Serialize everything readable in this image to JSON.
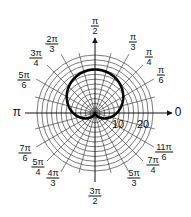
{
  "chart_data": {
    "type": "polar",
    "title": "",
    "curve": {
      "equation": "r = 9(1 + sin θ)",
      "description": "cardioid opening downward with cusp at origin",
      "a": 9,
      "color": "#000000"
    },
    "r_axis": {
      "ticks": [
        10,
        20
      ],
      "rings": [
        2,
        4,
        6,
        8,
        10,
        12,
        14,
        16,
        18,
        20,
        22,
        24
      ],
      "max": 24
    },
    "theta_spoke_step_deg": 15,
    "angle_labels": [
      {
        "num": "",
        "den": "",
        "text": "0",
        "angle_deg": 0
      },
      {
        "num": "π",
        "den": "6",
        "angle_deg": 30
      },
      {
        "num": "π",
        "den": "4",
        "angle_deg": 45
      },
      {
        "num": "π",
        "den": "3",
        "angle_deg": 60
      },
      {
        "num": "π",
        "den": "2",
        "angle_deg": 90
      },
      {
        "num": "2π",
        "den": "3",
        "angle_deg": 120
      },
      {
        "num": "3π",
        "den": "4",
        "angle_deg": 135
      },
      {
        "num": "5π",
        "den": "6",
        "angle_deg": 150
      },
      {
        "num": "",
        "den": "",
        "text": "π",
        "angle_deg": 180
      },
      {
        "num": "7π",
        "den": "6",
        "angle_deg": 210
      },
      {
        "num": "5π",
        "den": "4",
        "angle_deg": 225
      },
      {
        "num": "4π",
        "den": "3",
        "angle_deg": 240
      },
      {
        "num": "3π",
        "den": "2",
        "angle_deg": 270
      },
      {
        "num": "5π",
        "den": "3",
        "angle_deg": 300
      },
      {
        "num": "7π",
        "den": "4",
        "angle_deg": 315
      },
      {
        "num": "11π",
        "den": "6",
        "angle_deg": 330
      }
    ],
    "grid": true
  },
  "labels": {
    "zero": "0",
    "pi": "π",
    "r10": "10",
    "r20": "20",
    "pi_over_2": {
      "num": "π",
      "den": "2"
    },
    "pi_over_3": {
      "num": "π",
      "den": "3"
    },
    "pi_over_4": {
      "num": "π",
      "den": "4"
    },
    "pi_over_6": {
      "num": "π",
      "den": "6"
    },
    "two_pi_over_3": {
      "num": "2π",
      "den": "3"
    },
    "three_pi_over_4": {
      "num": "3π",
      "den": "4"
    },
    "five_pi_over_6": {
      "num": "5π",
      "den": "6"
    },
    "seven_pi_over_6": {
      "num": "7π",
      "den": "6"
    },
    "five_pi_over_4": {
      "num": "5π",
      "den": "4"
    },
    "four_pi_over_3": {
      "num": "4π",
      "den": "3"
    },
    "three_pi_over_2": {
      "num": "3π",
      "den": "2"
    },
    "five_pi_over_3": {
      "num": "5π",
      "den": "3"
    },
    "seven_pi_over_4": {
      "num": "7π",
      "den": "4"
    },
    "eleven_pi_over_6": {
      "num": "11π",
      "den": "6"
    }
  }
}
